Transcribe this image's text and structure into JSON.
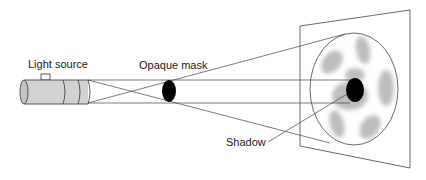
{
  "diagram": {
    "labels": {
      "light_source": "Light source",
      "opaque_mask": "Opaque mask",
      "shadow": "Shadow"
    },
    "colors": {
      "line": "#333333",
      "cylinder_fill": "#d2d2d2",
      "mask": "#000000",
      "blob": "#bdbdbd"
    }
  }
}
